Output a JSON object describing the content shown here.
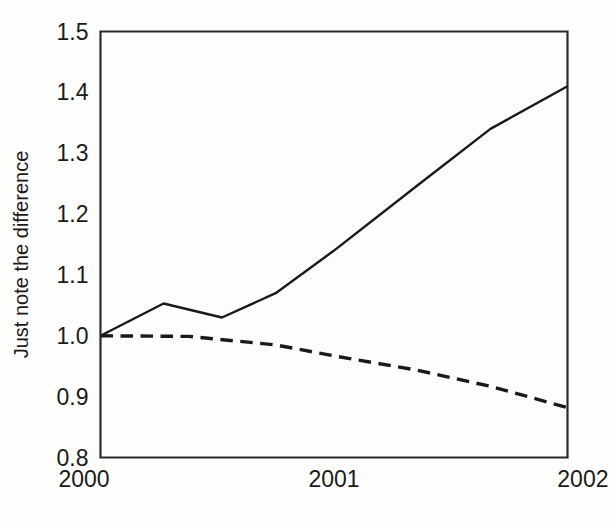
{
  "chart_data": {
    "type": "line",
    "title": "",
    "xlabel": "",
    "ylabel": "Just note the difference",
    "xlim": [
      2000,
      2002
    ],
    "ylim": [
      0.8,
      1.5
    ],
    "grid": false,
    "legend": "none",
    "x_tick_labels": [
      "2000",
      "2001",
      "2002"
    ],
    "x_tick_values": [
      2000,
      2001,
      2002
    ],
    "y_tick_labels": [
      "0.8",
      "0.9",
      "1.0",
      "1.1",
      "1.2",
      "1.3",
      "1.4",
      "1.5"
    ],
    "y_tick_values": [
      0.8,
      0.9,
      1.0,
      1.1,
      1.2,
      1.3,
      1.4,
      1.5
    ],
    "series": [
      {
        "name": "solid-series",
        "style": "solid",
        "color": "#1a1a1a",
        "x": [
          2000.0,
          2000.27,
          2000.52,
          2000.75,
          2001.0,
          2001.35,
          2001.67,
          2002.0
        ],
        "values": [
          1.0,
          1.053,
          1.03,
          1.07,
          1.14,
          1.245,
          1.34,
          1.41
        ]
      },
      {
        "name": "dashed-series",
        "style": "dashed",
        "color": "#1a1a1a",
        "x": [
          2000.0,
          2000.38,
          2000.75,
          2001.0,
          2001.35,
          2001.67,
          2002.0
        ],
        "values": [
          1.0,
          0.999,
          0.985,
          0.967,
          0.944,
          0.917,
          0.882
        ]
      }
    ]
  },
  "axes": {
    "y_label_text": "Just note the difference"
  }
}
